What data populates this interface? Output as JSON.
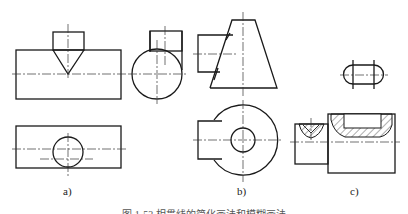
{
  "figure": {
    "subfigures": [
      {
        "id": "a",
        "label": "a)"
      },
      {
        "id": "b",
        "label": "b)"
      },
      {
        "id": "c",
        "label": "c)"
      }
    ],
    "caption": "图 1-53   相贯线的简化画法和模糊画法"
  },
  "colors": {
    "line": "#1a1a1a",
    "background": "#ffffff"
  }
}
